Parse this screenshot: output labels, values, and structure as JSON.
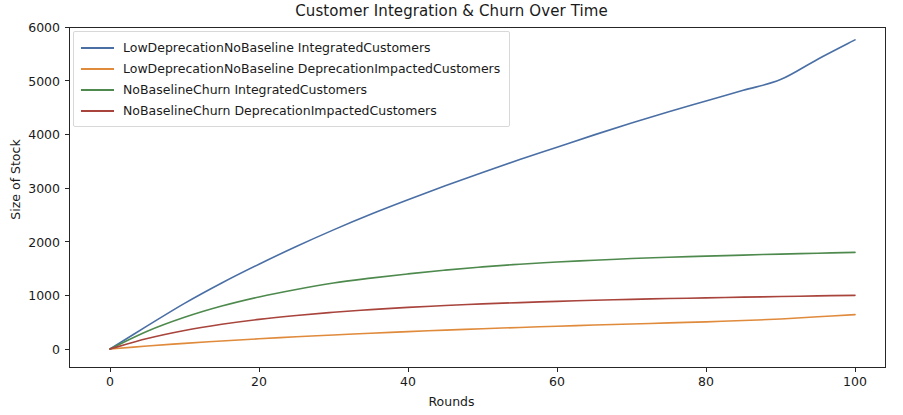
{
  "chart_data": {
    "type": "line",
    "title": "Customer Integration & Churn Over Time",
    "xlabel": "Rounds",
    "ylabel": "Size of Stock",
    "xlim": [
      -4,
      104
    ],
    "ylim": [
      -250,
      6200
    ],
    "xticks": [
      0,
      20,
      40,
      60,
      80,
      100
    ],
    "yticks": [
      0,
      1000,
      2000,
      3000,
      4000,
      5000,
      6000
    ],
    "grid": false,
    "legend_position": "upper left",
    "x": [
      0,
      5,
      10,
      15,
      20,
      25,
      30,
      35,
      40,
      45,
      50,
      55,
      60,
      65,
      70,
      75,
      80,
      85,
      90,
      95,
      100
    ],
    "series": [
      {
        "name": "LowDeprecationNoBaseline IntegratedCustomers",
        "color": "#4a6fa5",
        "values": [
          0,
          430,
          850,
          1230,
          1580,
          1910,
          2220,
          2510,
          2780,
          3040,
          3290,
          3530,
          3760,
          3990,
          4210,
          4420,
          4620,
          4820,
          5020,
          5400,
          5760
        ]
      },
      {
        "name": "LowDeprecationNoBaseline DeprecationImpactedCustomers",
        "color": "#e08a3c",
        "values": [
          0,
          55,
          105,
          150,
          190,
          228,
          262,
          294,
          324,
          352,
          378,
          402,
          424,
          446,
          466,
          486,
          506,
          530,
          560,
          600,
          640
        ]
      },
      {
        "name": "NoBaselineChurn IntegratedCustomers",
        "color": "#4e8a4e",
        "values": [
          0,
          330,
          590,
          800,
          970,
          1110,
          1230,
          1320,
          1400,
          1470,
          1530,
          1580,
          1620,
          1655,
          1685,
          1710,
          1730,
          1750,
          1768,
          1785,
          1800
        ]
      },
      {
        "name": "NoBaselineChurn DeprecationImpactedCustomers",
        "color": "#a8443c",
        "values": [
          0,
          195,
          345,
          460,
          552,
          625,
          685,
          734,
          775,
          810,
          840,
          865,
          888,
          907,
          925,
          940,
          953,
          966,
          978,
          990,
          1000
        ]
      }
    ]
  },
  "legend": {
    "entries": [
      {
        "label": "LowDeprecationNoBaseline IntegratedCustomers"
      },
      {
        "label": "LowDeprecationNoBaseline DeprecationImpactedCustomers"
      },
      {
        "label": "NoBaselineChurn IntegratedCustomers"
      },
      {
        "label": "NoBaselineChurn DeprecationImpactedCustomers"
      }
    ]
  },
  "axes": {
    "ytick_labels": [
      "0",
      "1000",
      "2000",
      "3000",
      "4000",
      "5000",
      "6000"
    ],
    "xtick_labels": [
      "0",
      "20",
      "40",
      "60",
      "80",
      "100"
    ]
  }
}
